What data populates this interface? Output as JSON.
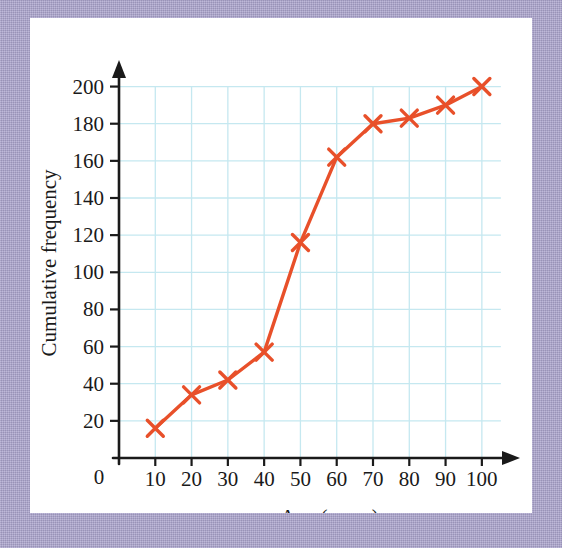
{
  "figure": {
    "background_color": "#ffffff",
    "mat_color": "#a9a2cb"
  },
  "chart_data": {
    "type": "line",
    "title": "",
    "subtitle": "",
    "xlabel": "Age (years)",
    "ylabel": "Cumulative frequency",
    "x": [
      10,
      20,
      30,
      40,
      50,
      60,
      70,
      80,
      90,
      100
    ],
    "values": [
      16,
      34,
      42,
      57,
      116,
      162,
      180,
      183,
      190,
      200
    ],
    "series": [
      {
        "name": "Cumulative frequency",
        "values": [
          16,
          34,
          42,
          57,
          116,
          162,
          180,
          183,
          190,
          200
        ]
      }
    ],
    "xlim": [
      0,
      105
    ],
    "ylim": [
      0,
      210
    ],
    "x_ticks": [
      10,
      20,
      30,
      40,
      50,
      60,
      70,
      80,
      90,
      100
    ],
    "x_tick_labels": [
      "10",
      "20",
      "30",
      "40",
      "50",
      "60",
      "70",
      "80",
      "90",
      "100"
    ],
    "y_ticks": [
      20,
      40,
      60,
      80,
      100,
      120,
      140,
      160,
      180,
      200
    ],
    "y_tick_labels": [
      "20",
      "40",
      "60",
      "80",
      "100",
      "120",
      "140",
      "160",
      "180",
      "200"
    ],
    "origin_label": "0",
    "grid": true,
    "grid_color": "#c5e8f0",
    "legend": false,
    "legend_position": "none",
    "line_color": "#e8502a",
    "marker": "x",
    "marker_color": "#e8502a",
    "axis_color": "#1a1a1a",
    "annotations": []
  }
}
